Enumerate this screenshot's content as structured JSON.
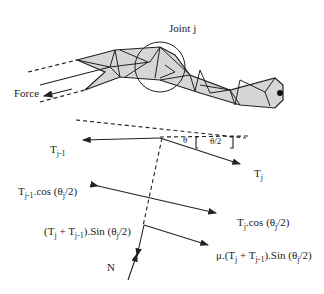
{
  "title": "Joint j",
  "labels": {
    "joint": "Joint j",
    "force": "Force",
    "theta": "θ",
    "theta_half": "θ/2",
    "t_prev": "T",
    "t_prev_sub": "j-1",
    "t_j": "T",
    "t_j_sub": "j",
    "t_prev_cos": "T",
    "t_prev_cos_sub": "j-1",
    "t_prev_cos_rest": ".cos (θ",
    "t_prev_cos_sub2": "j",
    "t_prev_cos_end": "/2)",
    "tj_cos": "T",
    "tj_cos_sub": "j",
    "tj_cos_rest": ".cos (θ",
    "tj_cos_sub2": "j",
    "tj_cos_end": "/2)",
    "sum_sin_a": "(T",
    "sum_sin_b": "j",
    "sum_sin_c": " + T",
    "sum_sin_d": "j-1",
    "sum_sin_e": ").Sin (θ",
    "sum_sin_f": "j",
    "sum_sin_g": "/2)",
    "mu_a": "μ.(T",
    "mu_b": "j",
    "mu_c": " + T",
    "mu_d": "j-1",
    "mu_e": ").Sin (θ",
    "mu_f": "j",
    "mu_g": "/2)",
    "normal": "N"
  },
  "colors": {
    "line": "#222222",
    "fill": "#d6d6d6"
  }
}
